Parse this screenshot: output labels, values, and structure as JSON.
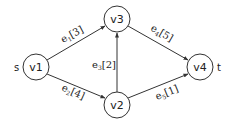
{
  "graph": {
    "nodes": [
      {
        "id": "v1",
        "label": "v1",
        "cx": 36,
        "cy": 67,
        "r": 13
      },
      {
        "id": "v3",
        "label": "v3",
        "cx": 117,
        "cy": 19,
        "r": 13
      },
      {
        "id": "v2",
        "label": "v2",
        "cx": 117,
        "cy": 105,
        "r": 13
      },
      {
        "id": "v4",
        "label": "v4",
        "cx": 200,
        "cy": 67,
        "r": 13
      }
    ],
    "source_label": "s",
    "sink_label": "t",
    "edges": [
      {
        "id": "e1",
        "name": "e",
        "sub": "1",
        "weight": "[3]",
        "from": "v1",
        "to": "v3"
      },
      {
        "id": "e2",
        "name": "e",
        "sub": "2",
        "weight": "[4]",
        "from": "v1",
        "to": "v2"
      },
      {
        "id": "e3",
        "name": "e",
        "sub": "3",
        "weight": "[2]",
        "from": "v2",
        "to": "v3"
      },
      {
        "id": "e4",
        "name": "e",
        "sub": "4",
        "weight": "[5]",
        "from": "v3",
        "to": "v4"
      },
      {
        "id": "e5",
        "name": "e",
        "sub": "5",
        "weight": "[1]",
        "from": "v2",
        "to": "v4"
      }
    ],
    "colors": {
      "stroke": "#333333",
      "text": "#222222",
      "background": "#ffffff"
    }
  }
}
